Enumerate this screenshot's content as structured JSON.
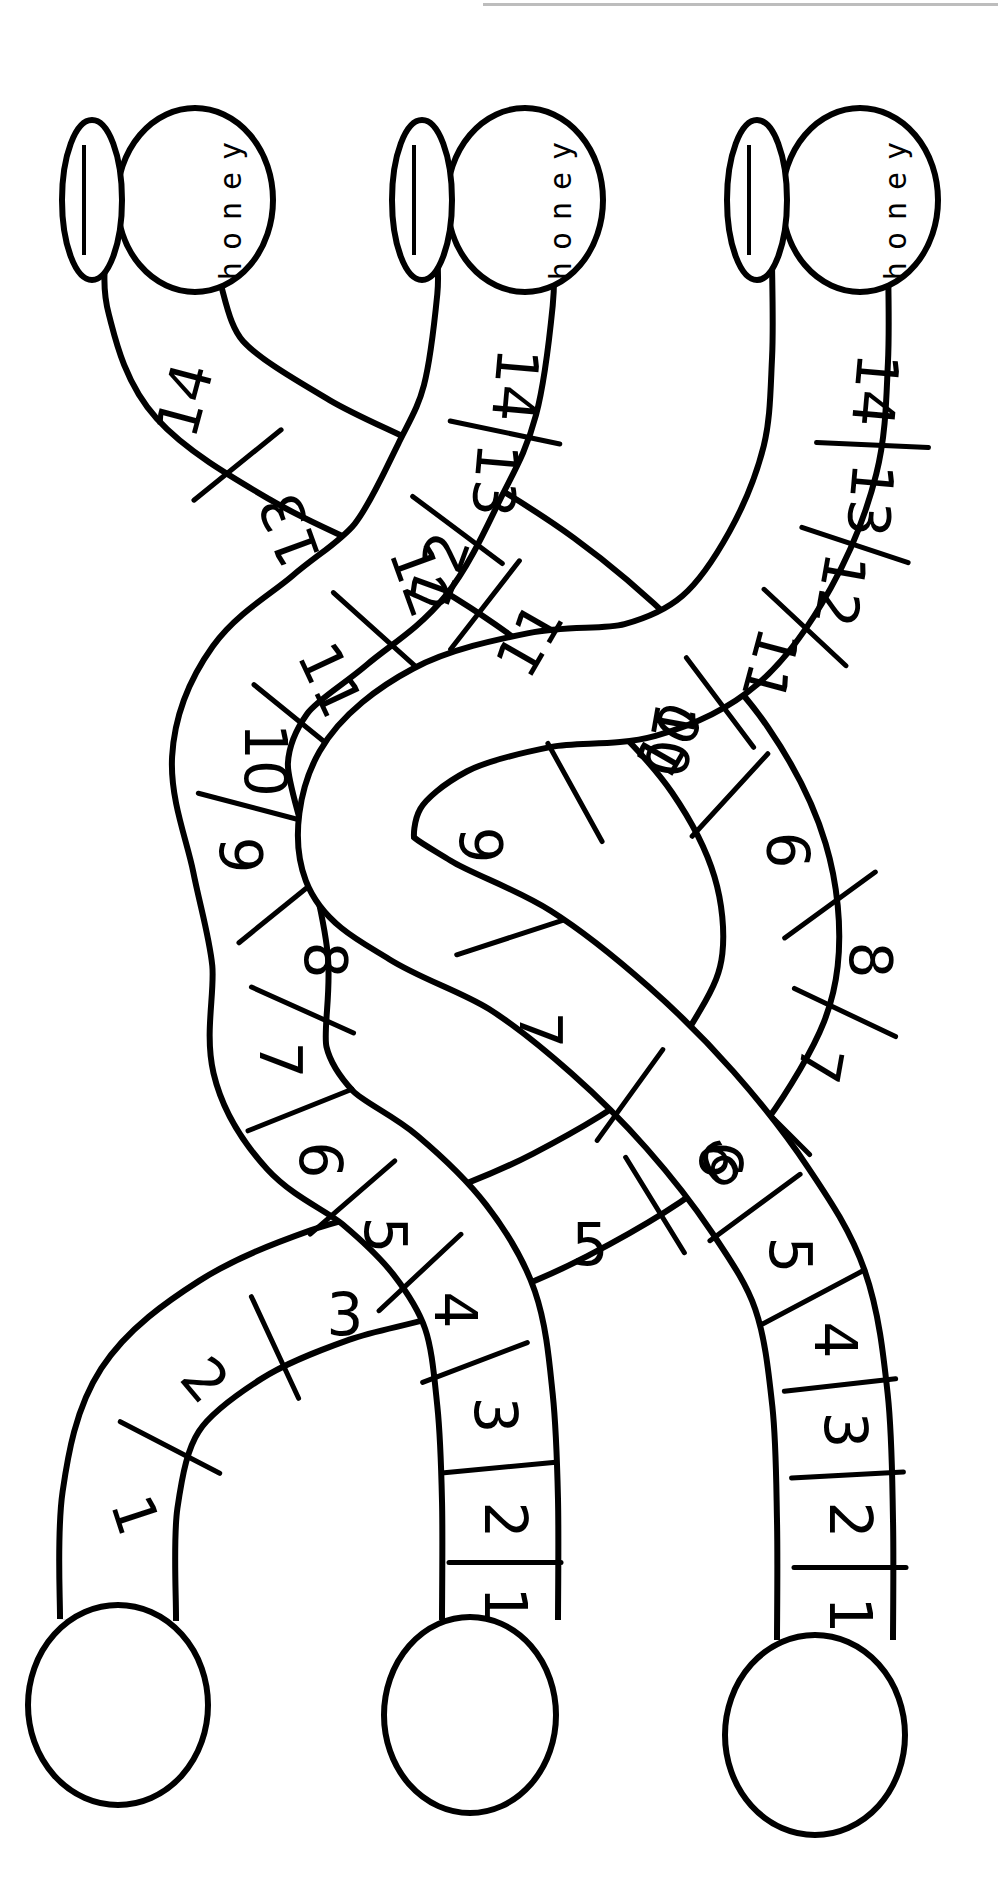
{
  "worksheet": {
    "title": "Honey pot number paths",
    "pot_label": "honey",
    "colors": {
      "ink": "#000000",
      "paper": "#ffffff",
      "top_rule": "#bdbdbd"
    },
    "tube_width": 112,
    "paths": [
      {
        "name": "left-path",
        "start_circle": {
          "cx": 118,
          "cy": 1705,
          "rx": 90,
          "ry": 100
        },
        "pot": {
          "cx": 195,
          "cy": 200,
          "rx": 78,
          "ry": 92,
          "lid_cx": 92,
          "lid_cy": 200,
          "lid_rx": 30,
          "lid_ry": 80
        },
        "centerline": [
          [
            118,
            1620
          ],
          [
            120,
            1500
          ],
          [
            150,
            1400
          ],
          [
            230,
            1330
          ],
          [
            330,
            1285
          ],
          [
            440,
            1255
          ],
          [
            560,
            1205
          ],
          [
            680,
            1130
          ],
          [
            750,
            1040
          ],
          [
            780,
            960
          ],
          [
            770,
            860
          ],
          [
            720,
            760
          ],
          [
            640,
            670
          ],
          [
            540,
            585
          ],
          [
            420,
            510
          ],
          [
            300,
            450
          ],
          [
            200,
            380
          ],
          [
            165,
            300
          ],
          [
            165,
            250
          ]
        ],
        "cells": [
          {
            "n": "1",
            "x": 135,
            "y": 1515,
            "r": 72
          },
          {
            "n": "2",
            "x": 205,
            "y": 1380,
            "r": 50
          },
          {
            "n": "3",
            "x": 345,
            "y": 1315,
            "r": 0
          },
          {
            "n": "5",
            "x": 590,
            "y": 1245,
            "r": 0
          },
          {
            "n": "6",
            "x": 720,
            "y": 1165,
            "r": -30
          },
          {
            "n": "7",
            "x": 820,
            "y": 1065,
            "r": 100
          },
          {
            "n": "8",
            "x": 870,
            "y": 960,
            "r": 90
          },
          {
            "n": "9",
            "x": 790,
            "y": 850,
            "r": -90
          },
          {
            "n": "10",
            "x": 670,
            "y": 740,
            "r": -60
          },
          {
            "n": "11",
            "x": 530,
            "y": 640,
            "r": -60
          },
          {
            "n": "12",
            "x": 440,
            "y": 570,
            "r": -70
          },
          {
            "n": "13",
            "x": 290,
            "y": 530,
            "r": -110
          },
          {
            "n": "14",
            "x": 185,
            "y": 400,
            "r": -75
          }
        ]
      },
      {
        "name": "middle-path",
        "start_circle": {
          "cx": 470,
          "cy": 1715,
          "rx": 86,
          "ry": 98
        },
        "pot": {
          "cx": 525,
          "cy": 200,
          "rx": 78,
          "ry": 92,
          "lid_cx": 422,
          "lid_cy": 200,
          "lid_rx": 30,
          "lid_ry": 80
        },
        "centerline": [
          [
            500,
            1620
          ],
          [
            500,
            1500
          ],
          [
            495,
            1400
          ],
          [
            480,
            1310
          ],
          [
            440,
            1240
          ],
          [
            380,
            1180
          ],
          [
            310,
            1130
          ],
          [
            270,
            1060
          ],
          [
            270,
            960
          ],
          [
            250,
            860
          ],
          [
            230,
            760
          ],
          [
            260,
            680
          ],
          [
            330,
            620
          ],
          [
            400,
            560
          ],
          [
            450,
            470
          ],
          [
            480,
            400
          ],
          [
            495,
            300
          ],
          [
            495,
            250
          ]
        ],
        "cells": [
          {
            "n": "1",
            "x": 505,
            "y": 1605,
            "r": 90
          },
          {
            "n": "2",
            "x": 505,
            "y": 1520,
            "r": 90
          },
          {
            "n": "3",
            "x": 495,
            "y": 1415,
            "r": 90
          },
          {
            "n": "4",
            "x": 455,
            "y": 1310,
            "r": 90
          },
          {
            "n": "5",
            "x": 385,
            "y": 1235,
            "r": 90
          },
          {
            "n": "6",
            "x": 320,
            "y": 1160,
            "r": 90
          },
          {
            "n": "7",
            "x": 280,
            "y": 1060,
            "r": 90
          },
          {
            "n": "8",
            "x": 325,
            "y": 960,
            "r": 90
          },
          {
            "n": "9",
            "x": 240,
            "y": 855,
            "r": 90
          },
          {
            "n": "10",
            "x": 265,
            "y": 760,
            "r": 90
          },
          {
            "n": "11",
            "x": 330,
            "y": 680,
            "r": 65
          },
          {
            "n": "12",
            "x": 420,
            "y": 580,
            "r": 70
          },
          {
            "n": "13",
            "x": 495,
            "y": 480,
            "r": 95
          },
          {
            "n": "14",
            "x": 515,
            "y": 385,
            "r": 95
          }
        ]
      },
      {
        "name": "right-path",
        "start_circle": {
          "cx": 815,
          "cy": 1735,
          "rx": 90,
          "ry": 100
        },
        "pot": {
          "cx": 860,
          "cy": 200,
          "rx": 78,
          "ry": 92,
          "lid_cx": 757,
          "lid_cy": 200,
          "lid_rx": 30,
          "lid_ry": 80
        },
        "centerline": [
          [
            835,
            1640
          ],
          [
            835,
            1520
          ],
          [
            830,
            1400
          ],
          [
            810,
            1290
          ],
          [
            760,
            1200
          ],
          [
            690,
            1110
          ],
          [
            610,
            1030
          ],
          [
            520,
            960
          ],
          [
            420,
            910
          ],
          [
            360,
            860
          ],
          [
            370,
            780
          ],
          [
            440,
            720
          ],
          [
            540,
            690
          ],
          [
            640,
            680
          ],
          [
            720,
            640
          ],
          [
            780,
            560
          ],
          [
            820,
            460
          ],
          [
            830,
            360
          ],
          [
            830,
            260
          ]
        ],
        "cells": [
          {
            "n": "1",
            "x": 850,
            "y": 1615,
            "r": 90
          },
          {
            "n": "2",
            "x": 850,
            "y": 1520,
            "r": 90
          },
          {
            "n": "3",
            "x": 845,
            "y": 1430,
            "r": 90
          },
          {
            "n": "4",
            "x": 835,
            "y": 1340,
            "r": 90
          },
          {
            "n": "5",
            "x": 790,
            "y": 1255,
            "r": 90
          },
          {
            "n": "6",
            "x": 720,
            "y": 1160,
            "r": 90
          },
          {
            "n": "7",
            "x": 540,
            "y": 1030,
            "r": 90
          },
          {
            "n": "9",
            "x": 480,
            "y": 845,
            "r": 90
          },
          {
            "n": "10",
            "x": 670,
            "y": 740,
            "r": 100
          },
          {
            "n": "11",
            "x": 770,
            "y": 665,
            "r": 105
          },
          {
            "n": "12",
            "x": 840,
            "y": 590,
            "r": 100
          },
          {
            "n": "13",
            "x": 870,
            "y": 500,
            "r": 95
          },
          {
            "n": "14",
            "x": 875,
            "y": 390,
            "r": 95
          }
        ]
      }
    ]
  }
}
